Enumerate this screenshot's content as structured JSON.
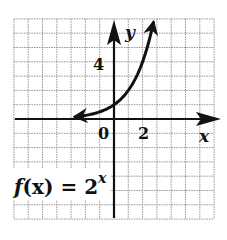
{
  "chart_data": {
    "type": "line",
    "function": "2^x",
    "xlabel": "x",
    "ylabel": "y",
    "xlim": [
      -7,
      7
    ],
    "ylim": [
      -7,
      7
    ],
    "grid": true,
    "grid_step": 1,
    "tick_labels": {
      "x": [
        {
          "value": 0,
          "label": "0"
        },
        {
          "value": 2,
          "label": "2"
        }
      ],
      "y": [
        {
          "value": 4,
          "label": "4"
        }
      ]
    },
    "series": [
      {
        "name": "f(x) = 2^x",
        "x": [
          -2.7,
          -2,
          -1,
          0,
          1,
          2,
          2.5,
          2.75
        ],
        "y": [
          0.15,
          0.25,
          0.5,
          1,
          2,
          4,
          5.66,
          6.73
        ],
        "arrows": "both"
      }
    ]
  },
  "labels": {
    "x_axis": "x",
    "y_axis": "y",
    "origin": "0",
    "x_tick": "2",
    "y_tick": "4",
    "func_prefix": "f",
    "func_arg": "(x) = 2",
    "func_exp": "x"
  },
  "colors": {
    "ink": "#111111",
    "grid": "#8a8a8a",
    "background": "#ffffff"
  }
}
